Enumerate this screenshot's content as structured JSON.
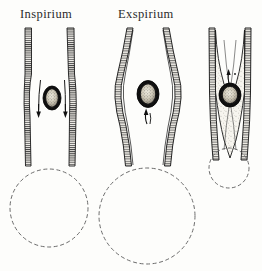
{
  "plate": {
    "title_left": "Inspirium",
    "title_right": "Exspirium",
    "ink_color": "#1a1a1a",
    "wall_fill": "#f2f0ea",
    "hatch_color": "#2a2a2a",
    "dashed_color": "#6b6b6b",
    "background": "#fdfdfb",
    "body_fill": "#111111",
    "body_speckle": "#d8d4c8"
  },
  "figures": [
    {
      "id": "inspirium",
      "label": "Inspirium",
      "state": "inspiration",
      "tube": "open-parallel",
      "arrow_count": 2,
      "arrow_direction": "down",
      "foreign_body": "seed",
      "lung_circle": {
        "cx": 49,
        "cy": 208,
        "r": 39
      }
    },
    {
      "id": "exspirium",
      "label": "Exspirium",
      "state": "expiration",
      "tube": "bulged",
      "arrow_count": 1,
      "arrow_direction": "up",
      "foreign_body": "seed",
      "lung_circle": {
        "cx": 147,
        "cy": 216,
        "r": 48
      }
    },
    {
      "id": "obstruction",
      "label": "",
      "state": "obstruction",
      "tube": "collapsed-taper",
      "arrow_count": 1,
      "arrow_direction": "up",
      "foreign_body": "seed",
      "lung_circle": {
        "cx": 229,
        "cy": 168,
        "r": 20
      }
    }
  ]
}
